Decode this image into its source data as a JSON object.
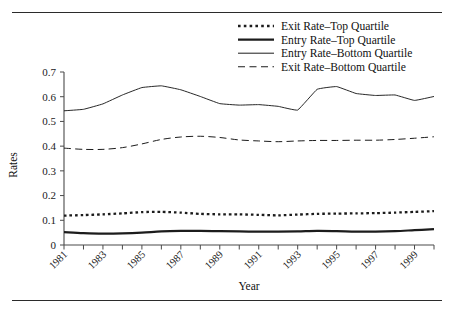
{
  "figure": {
    "clipped_header_text": "",
    "y_axis_title": "Rates",
    "x_axis_title": "Year"
  },
  "legend": {
    "position": "top-right",
    "items": [
      {
        "label": "Exit Rate–Top Quartile",
        "style": "dotted-thick",
        "key": "exit_top"
      },
      {
        "label": "Entry Rate–Top Quartile",
        "style": "solid-thick",
        "key": "entry_top"
      },
      {
        "label": "Entry Rate–Bottom Quartile",
        "style": "solid-thin",
        "key": "entry_bottom"
      },
      {
        "label": "Exit Rate–Bottom Quartile",
        "style": "dashed-thin",
        "key": "exit_bottom"
      }
    ]
  },
  "chart_data": {
    "type": "line",
    "title": "",
    "xlabel": "Year",
    "ylabel": "Rates",
    "xlim": [
      1981,
      2000
    ],
    "ylim": [
      0,
      0.7
    ],
    "grid": false,
    "legend_position": "top-right",
    "x": [
      1981,
      1982,
      1983,
      1984,
      1985,
      1986,
      1987,
      1988,
      1989,
      1990,
      1991,
      1992,
      1993,
      1994,
      1995,
      1996,
      1997,
      1998,
      1999,
      2000
    ],
    "ytick_labels": [
      "0",
      "0.1",
      "0.2",
      "0.3",
      "0.4",
      "0.5",
      "0.6",
      "0.7"
    ],
    "ytick_values": [
      0,
      0.1,
      0.2,
      0.3,
      0.4,
      0.5,
      0.6,
      0.7
    ],
    "xtick_labels": [
      "1981",
      "",
      "1983",
      "",
      "1985",
      "",
      "1987",
      "",
      "1989",
      "",
      "1991",
      "",
      "1993",
      "",
      "1995",
      "",
      "1997",
      "",
      "1999",
      ""
    ],
    "series": [
      {
        "name": "Exit Rate–Top Quartile",
        "style": "dotted-thick",
        "values": [
          0.119,
          0.121,
          0.124,
          0.128,
          0.133,
          0.134,
          0.131,
          0.126,
          0.124,
          0.124,
          0.122,
          0.12,
          0.123,
          0.126,
          0.127,
          0.128,
          0.129,
          0.131,
          0.134,
          0.137
        ]
      },
      {
        "name": "Entry Rate–Top Quartile",
        "style": "solid-thick",
        "values": [
          0.052,
          0.048,
          0.046,
          0.047,
          0.05,
          0.055,
          0.057,
          0.057,
          0.056,
          0.055,
          0.054,
          0.054,
          0.055,
          0.057,
          0.056,
          0.054,
          0.054,
          0.056,
          0.06,
          0.064
        ]
      },
      {
        "name": "Entry Rate–Bottom Quartile",
        "style": "solid-thin",
        "values": [
          0.543,
          0.549,
          0.571,
          0.607,
          0.637,
          0.644,
          0.628,
          0.601,
          0.572,
          0.566,
          0.568,
          0.561,
          0.546,
          0.63,
          0.641,
          0.613,
          0.605,
          0.607,
          0.585,
          0.601
        ]
      },
      {
        "name": "Exit Rate–Bottom Quartile",
        "style": "dashed-thin",
        "values": [
          0.392,
          0.387,
          0.387,
          0.394,
          0.409,
          0.427,
          0.437,
          0.44,
          0.435,
          0.425,
          0.421,
          0.418,
          0.421,
          0.423,
          0.423,
          0.424,
          0.424,
          0.427,
          0.432,
          0.438
        ]
      }
    ],
    "series_endpoint_note": {
      "entry_bottom_last": 0.571,
      "exit_bottom_last": 0.438
    }
  }
}
